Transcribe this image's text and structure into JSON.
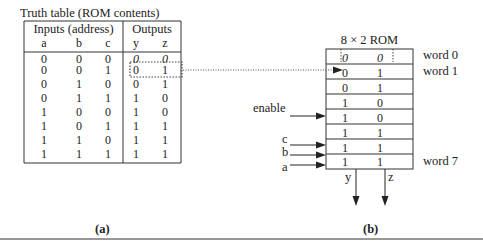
{
  "truth_table": {
    "title": "Truth table (ROM contents)",
    "group_headers": {
      "inputs": "Inputs (address)",
      "outputs": "Outputs"
    },
    "columns": [
      "a",
      "b",
      "c",
      "y",
      "z"
    ],
    "rows": [
      [
        "0",
        "0",
        "0",
        "0",
        "0"
      ],
      [
        "0",
        "0",
        "1",
        "0",
        "1"
      ],
      [
        "0",
        "1",
        "0",
        "0",
        "1"
      ],
      [
        "0",
        "1",
        "1",
        "1",
        "0"
      ],
      [
        "1",
        "0",
        "0",
        "1",
        "0"
      ],
      [
        "1",
        "0",
        "1",
        "1",
        "1"
      ],
      [
        "1",
        "1",
        "0",
        "1",
        "1"
      ],
      [
        "1",
        "1",
        "1",
        "1",
        "1"
      ]
    ],
    "caption": "(a)"
  },
  "rom": {
    "title": "8 × 2 ROM",
    "words": [
      [
        "0",
        "0"
      ],
      [
        "0",
        "1"
      ],
      [
        "0",
        "1"
      ],
      [
        "1",
        "0"
      ],
      [
        "1",
        "0"
      ],
      [
        "1",
        "1"
      ],
      [
        "1",
        "1"
      ],
      [
        "1",
        "1"
      ]
    ],
    "word_labels": {
      "first": "word 0",
      "second": "word 1",
      "last": "word 7"
    },
    "inputs": {
      "enable": "enable",
      "c": "c",
      "b": "b",
      "a": "a"
    },
    "outputs": {
      "y": "y",
      "z": "z"
    },
    "caption": "(b)"
  }
}
